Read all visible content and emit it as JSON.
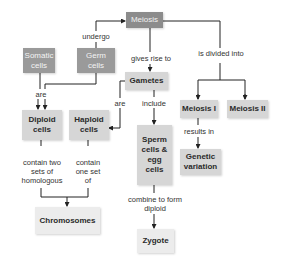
{
  "diagram": {
    "type": "concept-map",
    "nodes": {
      "meiosis": "Meiosis",
      "somatic": "Somatic cells",
      "germ": "Germ cells",
      "gametes": "Gametes",
      "diploid": "Diploid cells",
      "haploid": "Haploid cells",
      "meiosis1": "Meiosis I",
      "meiosis2": "Meiosis II",
      "sperm_egg": "Sperm cells & egg cells",
      "genetic_variation": "Genetic variation",
      "chromosomes": "Chromosomes",
      "zygote": "Zygote"
    },
    "labels": {
      "undergo": "undergo",
      "gives_rise_to": "gives rise to",
      "is_divided_into": "is divided into",
      "are_left": "are",
      "are_right": "are",
      "include": "include",
      "results_in": "results in",
      "contain_two": "contain two sets of homologous",
      "contain_one": "contain one set of",
      "combine": "combine to form diploid"
    },
    "edges": [
      {
        "from": "germ",
        "label": "undergo",
        "to": "meiosis"
      },
      {
        "from": "meiosis",
        "label": "gives rise to",
        "to": "gametes"
      },
      {
        "from": "meiosis",
        "label": "is divided into",
        "to": [
          "meiosis1",
          "meiosis2"
        ]
      },
      {
        "from": [
          "somatic",
          "germ"
        ],
        "label": "are",
        "to": "diploid"
      },
      {
        "from": "gametes",
        "label": "are",
        "to": "haploid"
      },
      {
        "from": "gametes",
        "label": "include",
        "to": "sperm_egg"
      },
      {
        "from": "meiosis1",
        "label": "results in",
        "to": "genetic_variation"
      },
      {
        "from": "diploid",
        "label": "contain two sets of homologous",
        "to": "chromosomes"
      },
      {
        "from": "haploid",
        "label": "contain one set of",
        "to": "chromosomes"
      },
      {
        "from": "sperm_egg",
        "label": "combine to form diploid",
        "to": "zygote"
      }
    ]
  }
}
